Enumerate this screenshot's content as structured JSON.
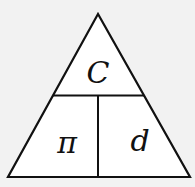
{
  "diagram": {
    "top": "C",
    "bottom_left": "π",
    "bottom_right": "d",
    "colors": {
      "background": "#f2f2f2",
      "fill": "#ffffff",
      "stroke": "#111111"
    }
  }
}
